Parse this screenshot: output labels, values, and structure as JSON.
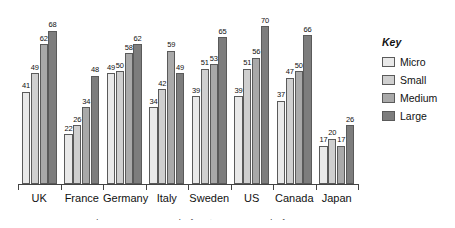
{
  "chart_data": {
    "type": "bar",
    "title": "",
    "xlabel": "",
    "ylabel": "",
    "ylim": [
      0,
      78
    ],
    "grid": false,
    "legend_position": "right",
    "categories": [
      "UK",
      "France",
      "Germany",
      "Italy",
      "Sweden",
      "US",
      "Canada",
      "Japan"
    ],
    "series": [
      {
        "name": "Micro",
        "color": "#e9e9e9",
        "values": [
          41,
          22,
          49,
          34,
          39,
          39,
          37,
          17
        ]
      },
      {
        "name": "Small",
        "color": "#cfcfcf",
        "values": [
          49,
          26,
          50,
          42,
          51,
          51,
          47,
          20
        ]
      },
      {
        "name": "Medium",
        "color": "#a9a9a9",
        "values": [
          62,
          34,
          58,
          59,
          53,
          56,
          50,
          17
        ]
      },
      {
        "name": "Large",
        "color": "#7d7d7d",
        "values": [
          68,
          48,
          62,
          49,
          65,
          70,
          66,
          26
        ]
      }
    ]
  },
  "legend": {
    "title": "Key",
    "items": [
      {
        "label": "Micro"
      },
      {
        "label": "Small"
      },
      {
        "label": "Medium"
      },
      {
        "label": "Large"
      }
    ]
  },
  "caption": {
    "text": "Source: Micro = enterprises with 1 to 9 employees; number of employees"
  }
}
